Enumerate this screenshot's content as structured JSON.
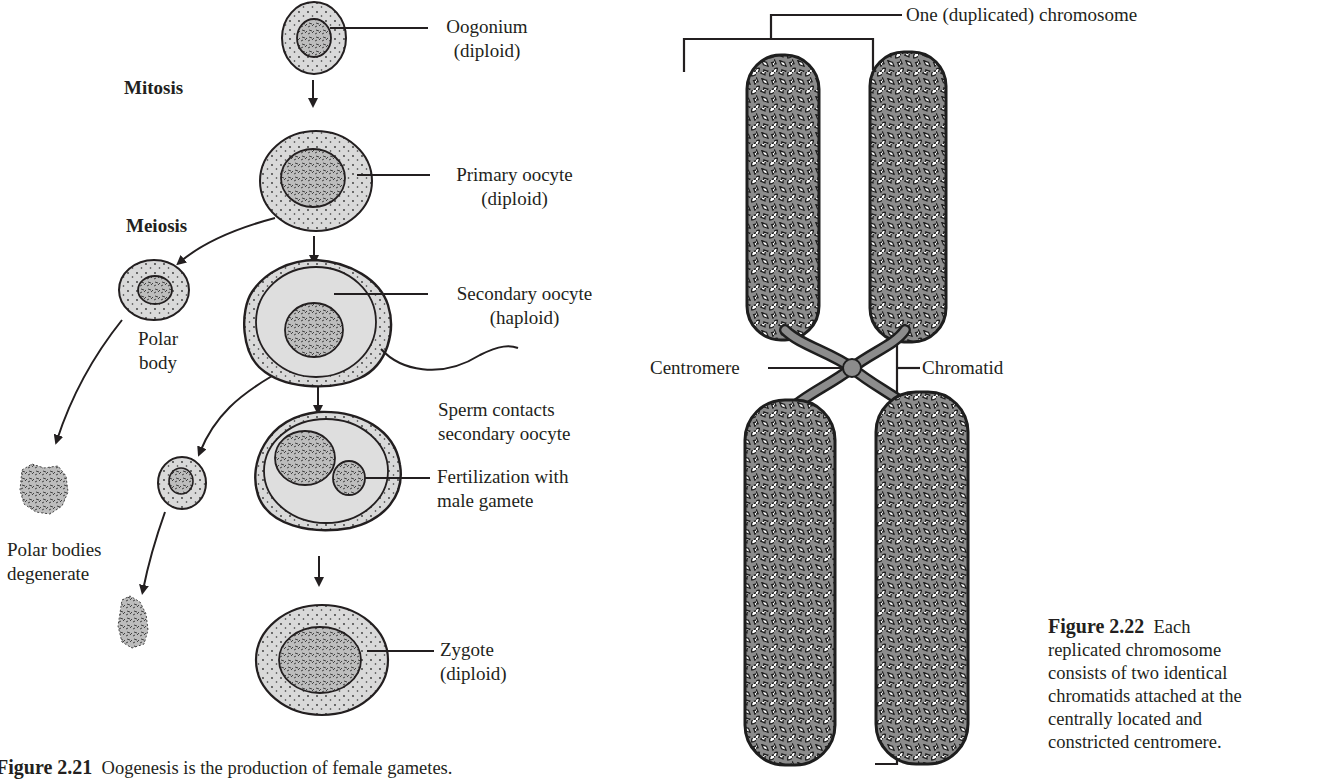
{
  "figure_2_21": {
    "stage_labels": {
      "mitosis": "Mitosis",
      "meiosis": "Meiosis"
    },
    "cells": [
      {
        "name": "Oogonium",
        "ploidy": "(diploid)"
      },
      {
        "name": "Primary oocyte",
        "ploidy": "(diploid)"
      },
      {
        "name": "Secondary oocyte",
        "ploidy": "(haploid)"
      },
      {
        "name": "Fertilization with",
        "name2": "male gamete"
      },
      {
        "name": "Zygote",
        "ploidy": "(diploid)"
      }
    ],
    "polar_body": {
      "line1": "Polar",
      "line2": "body"
    },
    "sperm_note": {
      "line1": "Sperm contacts",
      "line2": "secondary oocyte"
    },
    "degenerate": {
      "line1": "Polar bodies",
      "line2": "degenerate"
    },
    "caption": {
      "label": "Figure 2.21",
      "text": "Oogenesis is the production of female gametes."
    }
  },
  "figure_2_22": {
    "labels": {
      "chromosome": "One (duplicated) chromosome",
      "centromere": "Centromere",
      "chromatid": "Chromatid"
    },
    "caption": {
      "label": "Figure 2.22",
      "lines": [
        "Each",
        "replicated chromosome",
        "consists of two identical",
        "chromatids attached at the",
        "centrally located and",
        "constricted centromere."
      ]
    }
  },
  "colors": {
    "ink": "#231f20",
    "cytoplasm": "#d6d6d6",
    "nucleus": "#b8b8b8",
    "chromatin": "#8a8a8a"
  }
}
